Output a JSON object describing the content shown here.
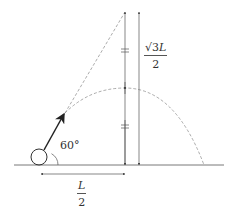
{
  "diagram": {
    "labels": {
      "angle": "60°",
      "height_num_root": "√3",
      "height_num_var": "L",
      "height_den": "2",
      "base_num": "L",
      "base_den": "2"
    },
    "elements": {
      "ground": "horizontal ground line",
      "ball": "circle (projectile)",
      "velocity": "arrow at 60° to horizontal",
      "trajectory": "dashed parabolic arc",
      "extension": "dashed line continuing initial velocity direction",
      "max_height_marker": "vertical dimension line with equal-length tick marks",
      "height_dimension": "vertical dimension √3L/2",
      "base_dimension": "horizontal dimension L/2"
    },
    "colors": {
      "line": "#555555",
      "dashed": "#888888",
      "arrow": "#222222"
    }
  }
}
